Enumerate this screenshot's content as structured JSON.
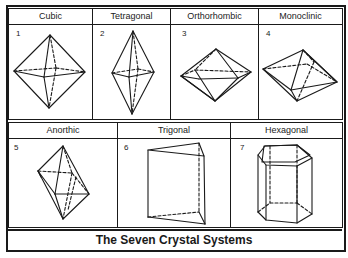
{
  "diagram": {
    "title": "The Seven Crystal Systems",
    "systems": [
      {
        "number": "1",
        "name": "Cubic",
        "shape": "octahedron"
      },
      {
        "number": "2",
        "name": "Tetragonal",
        "shape": "elongated-bipyramid"
      },
      {
        "number": "3",
        "name": "Orthorhombic",
        "shape": "rhombic-bipyramid"
      },
      {
        "number": "4",
        "name": "Monoclinic",
        "shape": "skewed-bipyramid"
      },
      {
        "number": "5",
        "name": "Anorthic",
        "shape": "triclinic-bipyramid"
      },
      {
        "number": "6",
        "name": "Trigonal",
        "shape": "triangular-prism"
      },
      {
        "number": "7",
        "name": "Hexagonal",
        "shape": "hexagonal-prism"
      }
    ],
    "colors": {
      "ink": "#1a1a1a",
      "background": "#ffffff"
    }
  }
}
